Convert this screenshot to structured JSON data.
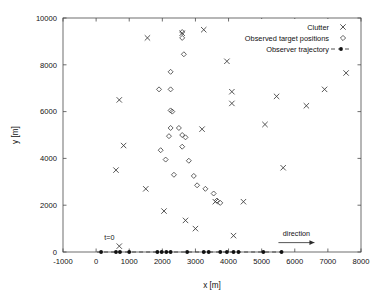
{
  "chart_data": {
    "type": "scatter",
    "title": "",
    "xlabel": "x [m]",
    "ylabel": "y [m]",
    "xlim": [
      -1000,
      8000
    ],
    "ylim": [
      0,
      10000
    ],
    "xticks": [
      -1000,
      0,
      1000,
      2000,
      3000,
      4000,
      5000,
      6000,
      7000,
      8000
    ],
    "yticks": [
      0,
      2000,
      4000,
      6000,
      8000,
      10000
    ],
    "xtick_labels": [
      "-1000",
      "0",
      "1000",
      "2000",
      "3000",
      "4000",
      "5000",
      "6000",
      "7000",
      "8000"
    ],
    "ytick_labels": [
      "0",
      "2000",
      "4000",
      "6000",
      "8000",
      "10000"
    ],
    "grid": false,
    "legend_position": "top-right",
    "series": [
      {
        "name": "Clutter",
        "marker": "x",
        "color": "#3a3a3a",
        "points": [
          [
            1550,
            9150
          ],
          [
            2600,
            9350
          ],
          [
            3250,
            9500
          ],
          [
            3950,
            8150
          ],
          [
            700,
            6500
          ],
          [
            4100,
            6850
          ],
          [
            4100,
            6350
          ],
          [
            5450,
            6650
          ],
          [
            6350,
            6250
          ],
          [
            6900,
            6950
          ],
          [
            7550,
            7650
          ],
          [
            5100,
            5450
          ],
          [
            3200,
            5250
          ],
          [
            830,
            4550
          ],
          [
            600,
            3500
          ],
          [
            1500,
            2700
          ],
          [
            2050,
            1750
          ],
          [
            2700,
            1350
          ],
          [
            4450,
            2150
          ],
          [
            5650,
            3600
          ],
          [
            4150,
            700
          ],
          [
            3000,
            1000
          ],
          [
            700,
            250
          ],
          [
            3600,
            2150
          ]
        ]
      },
      {
        "name": "Observed target positions",
        "marker": "diamond",
        "color": "#3a3a3a",
        "points": [
          [
            2600,
            9400
          ],
          [
            2600,
            9150
          ],
          [
            2650,
            8450
          ],
          [
            2250,
            7700
          ],
          [
            1900,
            6950
          ],
          [
            2250,
            6950
          ],
          [
            2250,
            6050
          ],
          [
            2300,
            6000
          ],
          [
            2250,
            5300
          ],
          [
            2500,
            5300
          ],
          [
            2200,
            4950
          ],
          [
            2600,
            5000
          ],
          [
            2700,
            4900
          ],
          [
            2600,
            4500
          ],
          [
            2100,
            3950
          ],
          [
            2800,
            3900
          ],
          [
            2350,
            3300
          ],
          [
            2950,
            3250
          ],
          [
            3050,
            2850
          ],
          [
            3300,
            2700
          ],
          [
            3550,
            2500
          ],
          [
            3650,
            2200
          ],
          [
            3750,
            2100
          ],
          [
            1950,
            4350
          ]
        ]
      },
      {
        "name": "Observer trajectory",
        "marker": "dot-dashed-line",
        "color": "#111111",
        "points": [
          [
            150,
            0
          ],
          [
            600,
            0
          ],
          [
            720,
            0
          ],
          [
            1000,
            0
          ],
          [
            1850,
            0
          ],
          [
            1980,
            0
          ],
          [
            2120,
            0
          ],
          [
            2250,
            0
          ],
          [
            2750,
            0
          ],
          [
            3250,
            0
          ],
          [
            3400,
            0
          ],
          [
            3750,
            0
          ],
          [
            3950,
            0
          ],
          [
            4150,
            0
          ],
          [
            4300,
            0
          ],
          [
            5050,
            0
          ],
          [
            5600,
            0
          ]
        ]
      }
    ],
    "annotations": [
      {
        "id": "t-zero",
        "text": "t=0",
        "x": 400,
        "y": 520
      },
      {
        "id": "direction",
        "text": "direction",
        "x": 6050,
        "y": 700
      }
    ],
    "legend_entries": [
      {
        "label": "Clutter",
        "marker": "x"
      },
      {
        "label": "Observed target positions",
        "marker": "diamond"
      },
      {
        "label": "Observer trajectory",
        "marker": "dot-dashed-line"
      }
    ]
  }
}
